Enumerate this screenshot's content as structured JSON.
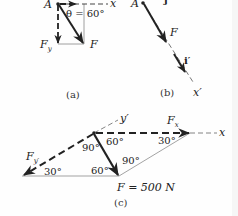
{
  "figure": {
    "panel_a": {
      "caption": "(a)",
      "point_label": "A",
      "axis_label": "x",
      "angle_label": "θ = 60°",
      "force_label": "F",
      "component_label": "F",
      "component_subscript": "y"
    },
    "panel_b": {
      "caption": "(b)",
      "point_label": "A",
      "unit_vector_top": "j",
      "force_label": "F",
      "unit_vector_label": "i′",
      "axis_label": "x′"
    },
    "panel_c": {
      "caption": "(c)",
      "axis_x_label": "x",
      "axis_y_label": "y′",
      "component_x_label": "F",
      "component_x_subscript": "x",
      "component_y_label": "F",
      "component_y_subscript": "y′",
      "force_value_label": "F = 500 N",
      "angles": {
        "top_right": "60°",
        "top_left": "90°",
        "right_corner": "30°",
        "left_corner": "30°",
        "bottom_left_of_F": "60°",
        "bottom_right_of_F": "90°"
      }
    },
    "colors": {
      "ink": "#222222",
      "thin_line": "#888888"
    }
  }
}
